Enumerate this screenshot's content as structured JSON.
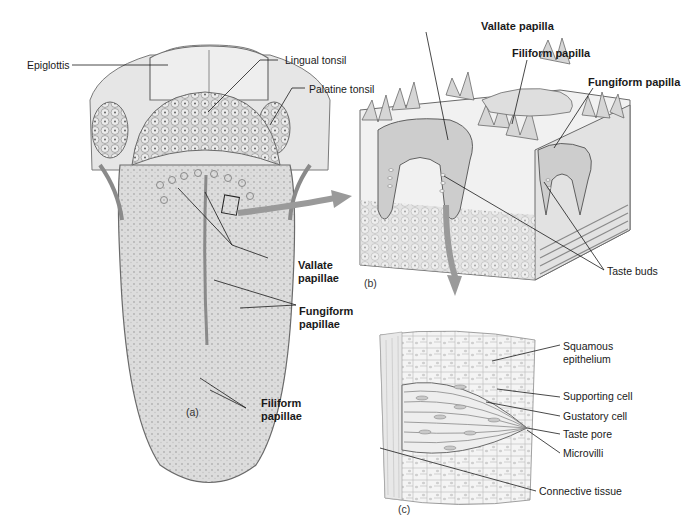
{
  "figure": {
    "panels": [
      {
        "id": "a",
        "tag": "(a)",
        "subject": "Dorsal surface of tongue",
        "labels": [
          "Epiglottis",
          "Lingual tonsil",
          "Palatine tonsil",
          "Vallate papillae",
          "Fungiform papillae",
          "Filiform papillae"
        ]
      },
      {
        "id": "b",
        "tag": "(b)",
        "subject": "Block of tongue tissue with papillae",
        "labels": [
          "Vallate papilla",
          "Filiform papilla",
          "Fungiform papilla",
          "Taste buds"
        ]
      },
      {
        "id": "c",
        "tag": "(c)",
        "subject": "Taste bud detail",
        "labels": [
          "Squamous epithelium",
          "Supporting cell",
          "Gustatory cell",
          "Taste pore",
          "Microvilli",
          "Connective tissue"
        ]
      }
    ]
  },
  "labels": {
    "epiglottis": "Epiglottis",
    "lingual_tonsil": "Lingual tonsil",
    "palatine_tonsil": "Palatine tonsil",
    "vallate_papillae_1": "Vallate",
    "vallate_papillae_2": "papillae",
    "fungiform_papillae_1": "Fungiform",
    "fungiform_papillae_2": "papillae",
    "filiform_papillae_1": "Filiform",
    "filiform_papillae_2": "papillae",
    "panel_a": "(a)",
    "vallate_papilla": "Vallate papilla",
    "filiform_papilla": "Filiform papilla",
    "fungiform_papilla": "Fungiform papilla",
    "taste_buds": "Taste buds",
    "panel_b": "(b)",
    "squamous_1": "Squamous",
    "squamous_2": "epithelium",
    "supporting_cell": "Supporting cell",
    "gustatory_cell": "Gustatory cell",
    "taste_pore": "Taste pore",
    "microvilli": "Microvilli",
    "connective_tissue": "Connective tissue",
    "panel_c": "(c)"
  },
  "colors": {
    "line": "#1a1a1a",
    "tissue_light": "#e4e4e4",
    "tissue_mid": "#bdbdbd",
    "tissue_dark": "#8f8f8f",
    "arrow": "#9a9a9a"
  }
}
